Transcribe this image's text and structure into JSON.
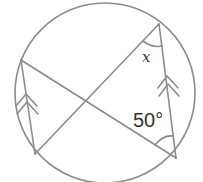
{
  "diagram": {
    "type": "circle-theorem",
    "stroke_color": "#8c8c8c",
    "text_color": "#333333",
    "circle": {
      "cx": 105,
      "cy": 93,
      "r": 90
    },
    "points": {
      "A": {
        "x": 159,
        "y": 24,
        "position": "top-right"
      },
      "B": {
        "x": 21,
        "y": 60,
        "position": "left"
      },
      "C": {
        "x": 35,
        "y": 154,
        "position": "bottom-left"
      },
      "D": {
        "x": 176,
        "y": 158,
        "position": "bottom-right"
      }
    },
    "chords": [
      {
        "from": "B",
        "to": "D"
      },
      {
        "from": "A",
        "to": "C"
      },
      {
        "from": "B",
        "to": "C",
        "parallel_marker": "double-arrow"
      },
      {
        "from": "A",
        "to": "D",
        "parallel_marker": "double-arrow"
      }
    ],
    "labels": {
      "angle_x": "x",
      "angle_50": "50°"
    },
    "angles": [
      {
        "vertex": "A",
        "between": [
          "C",
          "D"
        ],
        "label": "x"
      },
      {
        "vertex": "D",
        "between": [
          "B",
          "A"
        ],
        "label": "50°",
        "value_degrees": 50
      }
    ]
  }
}
